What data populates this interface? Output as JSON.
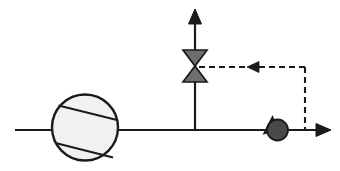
{
  "diagram": {
    "type": "p-and-id",
    "background_color": "#ffffff",
    "line_color": "#1a1a1a",
    "line_width": 2.2,
    "components": [
      {
        "id": "pump",
        "name": "centrifugal-pump",
        "label": "",
        "shape": "circle-with-two-chords",
        "cx": 85,
        "cy": 127.5,
        "r": 33,
        "fill_color": "#f1f1f1",
        "stroke_color": "#1a1a1a",
        "stroke_width": 2.2,
        "chords": [
          {
            "x1": 58.5,
            "y1": 105.5,
            "x2": 117.0,
            "y2": 120.0
          },
          {
            "x1": 55.5,
            "y1": 143.0,
            "x2": 113.0,
            "y2": 157.5
          }
        ]
      },
      {
        "id": "control-valve",
        "name": "control-valve-bowtie",
        "label": "",
        "shape": "bowtie",
        "cx": 195,
        "cy": 66,
        "half_width": 12,
        "half_height": 16,
        "fill_color": "#6e6e6e",
        "stroke_color": "#1a1a1a",
        "stroke_width": 1.6
      },
      {
        "id": "flow-sensor",
        "name": "flow-sensor-transmitter",
        "label": "",
        "shape": "filled-circle-with-pointer",
        "cx": 277,
        "cy": 130,
        "r": 10.5,
        "fill_color": "#4a4a4a",
        "stroke_color": "#1a1a1a",
        "stroke_width": 1.8,
        "pointer": {
          "x1": 264.0,
          "y1": 133.5,
          "x2": 277.0,
          "y2": 130.0,
          "x3": 272.0,
          "y3": 117.0
        }
      }
    ],
    "process_lines": [
      {
        "id": "inlet-line",
        "name": "inlet-process-line",
        "x1": 15,
        "y1": 130,
        "x2": 53,
        "y2": 130
      },
      {
        "id": "pump-discharge-line",
        "name": "pump-discharge-process-line",
        "x1": 117,
        "y1": 130,
        "x2": 267,
        "y2": 130
      },
      {
        "id": "outlet-line",
        "name": "outlet-process-line",
        "x1": 288,
        "y1": 130,
        "x2": 325,
        "y2": 130
      },
      {
        "id": "valve-riser-lower",
        "name": "valve-riser-lower-line",
        "x1": 195,
        "y1": 130,
        "x2": 195,
        "y2": 82
      },
      {
        "id": "valve-riser-upper",
        "name": "valve-riser-upper-line",
        "x1": 195,
        "y1": 50,
        "x2": 195,
        "y2": 16
      }
    ],
    "arrows": [
      {
        "id": "vent-arrow",
        "name": "vent-outlet-arrow",
        "direction": "up",
        "tip_x": 195,
        "tip_y": 9,
        "size": 7.5
      },
      {
        "id": "discharge-arrow",
        "name": "discharge-outlet-arrow",
        "direction": "right",
        "tip_x": 331,
        "tip_y": 130,
        "size": 7.5
      }
    ],
    "signal_lines": [
      {
        "id": "signal-horizontal",
        "name": "controller-signal-horizontal",
        "x1": 305,
        "y1": 67,
        "x2": 199,
        "y2": 67,
        "style": "dashed",
        "dash_pattern": "6,4",
        "stroke_width": 2.0
      },
      {
        "id": "signal-vertical",
        "name": "controller-signal-vertical",
        "x1": 305,
        "y1": 67,
        "x2": 305,
        "y2": 130,
        "style": "dashed",
        "dash_pattern": "6,4",
        "stroke_width": 2.0
      }
    ],
    "signal_arrows": [
      {
        "id": "signal-arrow-left",
        "name": "signal-direction-arrow",
        "direction": "left",
        "tip_x": 247,
        "tip_y": 67,
        "size": 6.5
      }
    ]
  }
}
